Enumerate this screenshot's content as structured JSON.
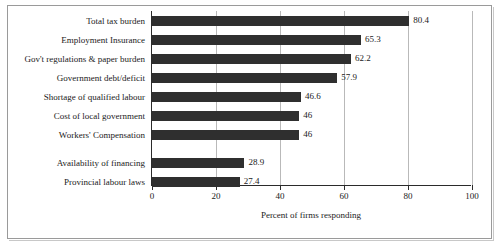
{
  "chart_data": {
    "type": "bar",
    "orientation": "horizontal",
    "title": "",
    "xlabel": "Percent of firms responding",
    "ylabel": "",
    "xlim": [
      0,
      100
    ],
    "xticks": [
      0,
      20,
      40,
      60,
      80,
      100
    ],
    "xtick_labels": [
      "0",
      "20",
      "40",
      "60",
      "80",
      "100"
    ],
    "grid": true,
    "grid_axis": "x",
    "legend": false,
    "bar_color": "#2f2f2f",
    "categories": [
      "Total tax burden",
      "Employment Insurance",
      "Gov't regulations & paper burden",
      "Government debt/deficit",
      "Shortage of qualified labour",
      "Cost of local government",
      "Workers' Compensation",
      "Availability of financing",
      "Provincial labour laws"
    ],
    "values": [
      80.4,
      65.3,
      62.2,
      57.9,
      46.6,
      46,
      46,
      28.9,
      27.4
    ],
    "value_labels": [
      "80.4",
      "65.3",
      "62.2",
      "57.9",
      "46.6",
      "46",
      "46",
      "28.9",
      "27.4"
    ]
  }
}
